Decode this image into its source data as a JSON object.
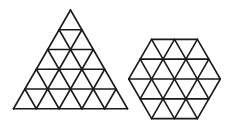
{
  "figure": {
    "width": 231,
    "height": 136,
    "stroke_color": "#1a1a1a",
    "background": "#ffffff",
    "shapes": [
      {
        "name": "subdivided-triangle",
        "type": "triangle",
        "side_units": 5,
        "unit": 22.8,
        "apex": [
          70.5,
          10
        ],
        "base_y": 124
      },
      {
        "name": "subdivided-hexagon",
        "type": "hexagon",
        "side_units": 2,
        "unit": 22.9,
        "center": [
          174.5,
          79
        ]
      }
    ]
  }
}
